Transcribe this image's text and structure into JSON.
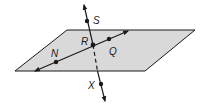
{
  "diagram": {
    "type": "geometry-plane-lines",
    "colors": {
      "plane_fill": "#d9d9d9",
      "plane_stroke": "#1a1a1a",
      "line": "#1a1a1a",
      "background": "#ffffff"
    },
    "plane": {
      "points": "67,30 195,30 145,71 15,71"
    },
    "points": [
      {
        "id": "S",
        "label": "S",
        "x": 87,
        "y": 21,
        "lx": 93,
        "ly": 23
      },
      {
        "id": "R",
        "label": "R",
        "x": 93,
        "y": 45,
        "lx": 80,
        "ly": 45
      },
      {
        "id": "N",
        "label": "N",
        "x": 56,
        "y": 62,
        "lx": 51,
        "ly": 56
      },
      {
        "id": "Q",
        "label": "Q",
        "x": 109,
        "y": 39,
        "lx": 109,
        "ly": 54
      },
      {
        "id": "X",
        "label": "X",
        "x": 101,
        "y": 84,
        "lx": 88,
        "ly": 88
      }
    ]
  }
}
